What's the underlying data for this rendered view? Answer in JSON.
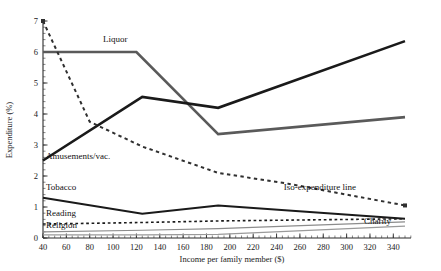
{
  "chart_data": {
    "type": "line",
    "title": "",
    "xlabel": "Income per family member ($)",
    "ylabel": "Expenditure (%)",
    "xlim": [
      40,
      350
    ],
    "ylim": [
      0,
      7
    ],
    "xticks": [
      40,
      60,
      80,
      100,
      120,
      140,
      160,
      180,
      200,
      220,
      240,
      260,
      280,
      300,
      320,
      340
    ],
    "yticks": [
      0,
      1,
      2,
      3,
      4,
      5,
      6,
      7
    ],
    "grid": false,
    "legend_position": "inline-labels",
    "series": [
      {
        "name": "Liquor",
        "label": "Liquor",
        "style": "solid",
        "color": "#5a5a5a",
        "width": 2.6,
        "x": [
          40,
          120,
          190,
          350
        ],
        "y": [
          6.0,
          6.0,
          3.35,
          3.9
        ],
        "label_x": 103,
        "label_y": 42
      },
      {
        "name": "Amusements/vac.",
        "label": "Amusements/vac.",
        "style": "solid",
        "color": "#1a1a1a",
        "width": 2.6,
        "x": [
          40,
          125,
          190,
          350
        ],
        "y": [
          2.5,
          4.55,
          4.2,
          6.35
        ],
        "label_x": 46,
        "label_y": 159
      },
      {
        "name": "Iso-expenditure line",
        "label": "Iso-expenditure line",
        "style": "dashed",
        "color": "#303030",
        "width": 2.0,
        "x": [
          40,
          80,
          125,
          190,
          250,
          350
        ],
        "y": [
          7.0,
          3.75,
          2.95,
          2.1,
          1.75,
          1.05
        ],
        "label_x": 356,
        "label_y": 190
      },
      {
        "name": "Tobacco",
        "label": "Tobacco",
        "style": "solid",
        "color": "#1a1a1a",
        "width": 2.0,
        "x": [
          40,
          125,
          190,
          350
        ],
        "y": [
          1.3,
          0.78,
          1.05,
          0.62
        ],
        "label_x": 46,
        "label_y": 190
      },
      {
        "name": "Reading",
        "label": "Reading",
        "style": "dashed",
        "color": "#1a1a1a",
        "width": 1.6,
        "x": [
          40,
          125,
          190,
          350
        ],
        "y": [
          0.45,
          0.5,
          0.55,
          0.62
        ],
        "label_x": 46,
        "label_y": 216
      },
      {
        "name": "Religion",
        "label": "Religion",
        "style": "solid",
        "color": "#8c8c8c",
        "width": 1.2,
        "x": [
          40,
          125,
          190,
          350
        ],
        "y": [
          0.2,
          0.25,
          0.3,
          0.52
        ],
        "label_x": 46,
        "label_y": 228
      },
      {
        "name": "Charity",
        "label": "Charity",
        "style": "solid",
        "color": "#9a9a9a",
        "width": 1.2,
        "x": [
          40,
          125,
          190,
          350
        ],
        "y": [
          0.1,
          0.1,
          0.12,
          0.38
        ],
        "label_x": 391,
        "label_y": 224
      }
    ]
  },
  "axes": {
    "xlabel": "Income per family member ($)",
    "ylabel": "Expenditure (%)"
  }
}
